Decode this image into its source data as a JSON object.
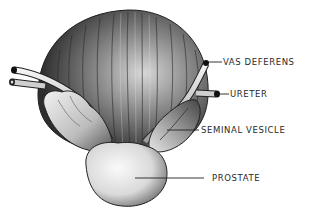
{
  "figure": {
    "top_text_faint": "",
    "labels": [
      {
        "id": "vas-deferens",
        "text": "VAS DEFERENS"
      },
      {
        "id": "ureter",
        "text": "URETER"
      },
      {
        "id": "seminal-vesicle",
        "text": "SEMINAL VESICLE"
      },
      {
        "id": "prostate",
        "text": "PROSTATE"
      }
    ]
  },
  "colors": {
    "background": "#ffffff",
    "ink": "#2a2a2a",
    "organ_dark": "#3a3a3a",
    "organ_mid": "#8a8a8a",
    "organ_light": "#e8e8e8"
  }
}
